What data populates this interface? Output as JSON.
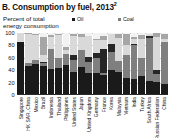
{
  "title": {
    "text": "B. Consumption by fuel, 2013",
    "footnote_marker": "2"
  },
  "axis_caption": "Percent of total energy consumption",
  "colors": {
    "oil": "#1a1a1a",
    "coal": "#7f7f7f",
    "nuclear_energy": "#262626",
    "natural_gas": "#d9d9d9",
    "hydro_electric": "#a6a6a6",
    "renewables": "#f2f2f2",
    "axis": "#2b2b2b",
    "grid": "#c9c9c9"
  },
  "legend": {
    "items": [
      {
        "label": "Oil",
        "key": "oil"
      },
      {
        "label": "Coal",
        "key": "coal"
      },
      {
        "label": "Nuclear energy",
        "key": "nuclear_energy"
      },
      {
        "label": "Natural gas",
        "key": "natural_gas"
      },
      {
        "label": "Hydro electric",
        "key": "hydro_electric"
      },
      {
        "label": "Renewables",
        "key": "renewables"
      }
    ]
  },
  "chart_data": {
    "type": "bar",
    "subtype": "stacked-bar",
    "title": "B. Consumption by fuel, 2013",
    "xlabel": "",
    "ylabel": "Percent of total energy consumption",
    "ylim": [
      0,
      100
    ],
    "yticks": [
      0,
      20,
      40,
      60,
      80,
      100
    ],
    "grid": true,
    "legend_position": "top-right",
    "categories": [
      "Singapore",
      "HK SAR, China",
      "Mexico",
      "Brazil",
      "Indonesia",
      "Thailand",
      "Philippines",
      "United States",
      "Japan",
      "United Kingdom",
      "Germany",
      "France",
      "Korea",
      "Malaysia",
      "Vietnam",
      "India",
      "Turkey",
      "South Africa",
      "Russian Federation",
      "China"
    ],
    "series": [
      {
        "name": "Oil",
        "key": "oil",
        "values": [
          86,
          46,
          50,
          47,
          42,
          43,
          48,
          37,
          45,
          36,
          35,
          32,
          40,
          37,
          28,
          26,
          30,
          22,
          21,
          18
        ]
      },
      {
        "name": "Coal",
        "key": "coal",
        "values": [
          0,
          6,
          6,
          5,
          33,
          17,
          18,
          20,
          27,
          18,
          25,
          4,
          30,
          18,
          36,
          55,
          29,
          70,
          13,
          67
        ]
      },
      {
        "name": "Nuclear energy",
        "key": "nuclear_energy",
        "values": [
          0,
          0,
          1,
          1,
          0,
          0,
          0,
          8,
          0,
          8,
          7,
          38,
          13,
          0,
          0,
          1,
          0,
          3,
          6,
          1
        ]
      },
      {
        "name": "Natural gas",
        "key": "natural_gas",
        "values": [
          14,
          47,
          40,
          12,
          19,
          37,
          7,
          30,
          22,
          33,
          22,
          15,
          16,
          37,
          17,
          8,
          31,
          3,
          54,
          5
        ]
      },
      {
        "name": "Hydro electric",
        "key": "hydro_electric",
        "values": [
          0,
          1,
          2,
          29,
          3,
          1,
          5,
          3,
          4,
          1,
          2,
          6,
          0,
          7,
          18,
          4,
          7,
          0,
          6,
          7
        ]
      },
      {
        "name": "Renewables",
        "key": "renewables",
        "values": [
          0,
          0,
          1,
          6,
          3,
          2,
          22,
          2,
          2,
          4,
          9,
          5,
          1,
          1,
          1,
          6,
          3,
          2,
          0,
          2
        ]
      }
    ]
  }
}
